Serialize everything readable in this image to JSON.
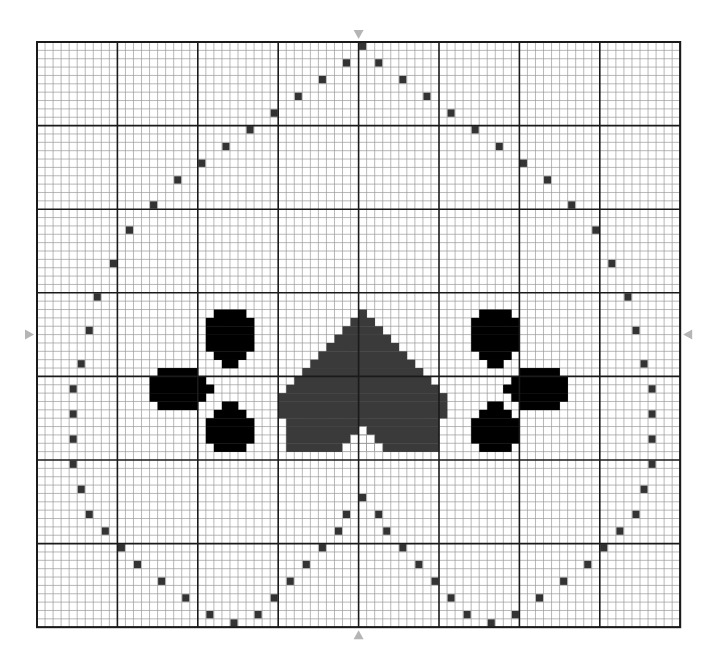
{
  "pattern": {
    "title": "Cross-stitch chart",
    "grid": {
      "cols": 80,
      "rows": 70,
      "major_every": 10,
      "origin_x": 37,
      "origin_y": 42,
      "cell_w": 8.04,
      "cell_h": 8.36,
      "minor_color": "#9a9a9a",
      "major_color": "#1a1a1a",
      "border_color": "#1a1a1a"
    },
    "center_markers": {
      "color": "#b5b5b5",
      "positions": [
        "top",
        "bottom",
        "left",
        "right"
      ],
      "icon": "arrow-marker"
    },
    "colors": {
      "outline_dot": "#333333",
      "heart": "#3a3a3a",
      "flowers": "#000000"
    },
    "outline_dots": [
      [
        40,
        0
      ],
      [
        38,
        2
      ],
      [
        42,
        2
      ],
      [
        35,
        4
      ],
      [
        45,
        4
      ],
      [
        32,
        6
      ],
      [
        48,
        6
      ],
      [
        29,
        8
      ],
      [
        51,
        8
      ],
      [
        26,
        10
      ],
      [
        54,
        10
      ],
      [
        23,
        12
      ],
      [
        57,
        12
      ],
      [
        20,
        14
      ],
      [
        60,
        14
      ],
      [
        17,
        16
      ],
      [
        63,
        16
      ],
      [
        14,
        19
      ],
      [
        66,
        19
      ],
      [
        11,
        22
      ],
      [
        69,
        22
      ],
      [
        9,
        26
      ],
      [
        71,
        26
      ],
      [
        7,
        30
      ],
      [
        73,
        30
      ],
      [
        6,
        34
      ],
      [
        74,
        34
      ],
      [
        5,
        38
      ],
      [
        75,
        38
      ],
      [
        4,
        41
      ],
      [
        76,
        41
      ],
      [
        4,
        44
      ],
      [
        76,
        44
      ],
      [
        4,
        47
      ],
      [
        76,
        47
      ],
      [
        4,
        50
      ],
      [
        76,
        50
      ],
      [
        5,
        53
      ],
      [
        75,
        53
      ],
      [
        6,
        56
      ],
      [
        74,
        56
      ],
      [
        8,
        58
      ],
      [
        72,
        58
      ],
      [
        10,
        60
      ],
      [
        70,
        60
      ],
      [
        12,
        62
      ],
      [
        68,
        62
      ],
      [
        15,
        64
      ],
      [
        65,
        64
      ],
      [
        18,
        66
      ],
      [
        62,
        66
      ],
      [
        21,
        68
      ],
      [
        59,
        68
      ],
      [
        24,
        69
      ],
      [
        56,
        69
      ],
      [
        27,
        68
      ],
      [
        53,
        68
      ],
      [
        29,
        66
      ],
      [
        51,
        66
      ],
      [
        31,
        64
      ],
      [
        49,
        64
      ],
      [
        33,
        62
      ],
      [
        47,
        62
      ],
      [
        35,
        60
      ],
      [
        45,
        60
      ],
      [
        37,
        58
      ],
      [
        43,
        58
      ],
      [
        38,
        56
      ],
      [
        42,
        56
      ],
      [
        40,
        54
      ]
    ],
    "heart": {
      "rows": [
        [
          32,
          40,
          40
        ],
        [
          33,
          39,
          41
        ],
        [
          34,
          38,
          42
        ],
        [
          35,
          37,
          43
        ],
        [
          36,
          36,
          44
        ],
        [
          37,
          35,
          45
        ],
        [
          38,
          34,
          46
        ],
        [
          39,
          33,
          47
        ],
        [
          40,
          32,
          48
        ],
        [
          41,
          31,
          49
        ],
        [
          42,
          30,
          50
        ],
        [
          43,
          30,
          50
        ],
        [
          44,
          30,
          50
        ],
        [
          45,
          31,
          49
        ],
        [
          46,
          31,
          49
        ],
        [
          47,
          31,
          49
        ],
        [
          48,
          31,
          49
        ]
      ],
      "bottom_notch": {
        "row_start": 46,
        "col": 40
      }
    },
    "left_flower": {
      "petals": [
        {
          "rows": [
            [
              32,
              22,
              25
            ],
            [
              33,
              21,
              26
            ],
            [
              34,
              21,
              26
            ],
            [
              35,
              21,
              26
            ],
            [
              36,
              21,
              26
            ],
            [
              37,
              22,
              25
            ],
            [
              38,
              23,
              24
            ]
          ]
        },
        {
          "rows": [
            [
              39,
              15,
              19
            ],
            [
              40,
              14,
              20
            ],
            [
              41,
              14,
              21
            ],
            [
              42,
              14,
              20
            ],
            [
              43,
              15,
              19
            ]
          ]
        },
        {
          "rows": [
            [
              43,
              23,
              24
            ],
            [
              44,
              22,
              25
            ],
            [
              45,
              21,
              26
            ],
            [
              46,
              21,
              26
            ],
            [
              47,
              21,
              26
            ],
            [
              48,
              22,
              25
            ]
          ]
        }
      ]
    },
    "right_flower": {
      "petals": [
        {
          "rows": [
            [
              32,
              55,
              58
            ],
            [
              33,
              54,
              59
            ],
            [
              34,
              54,
              59
            ],
            [
              35,
              54,
              59
            ],
            [
              36,
              54,
              59
            ],
            [
              37,
              55,
              58
            ],
            [
              38,
              56,
              57
            ]
          ]
        },
        {
          "rows": [
            [
              39,
              60,
              64
            ],
            [
              40,
              59,
              65
            ],
            [
              41,
              58,
              65
            ],
            [
              42,
              59,
              65
            ],
            [
              43,
              60,
              64
            ]
          ]
        },
        {
          "rows": [
            [
              43,
              56,
              57
            ],
            [
              44,
              55,
              58
            ],
            [
              45,
              54,
              59
            ],
            [
              46,
              54,
              59
            ],
            [
              47,
              54,
              59
            ],
            [
              48,
              55,
              58
            ]
          ]
        }
      ]
    }
  }
}
